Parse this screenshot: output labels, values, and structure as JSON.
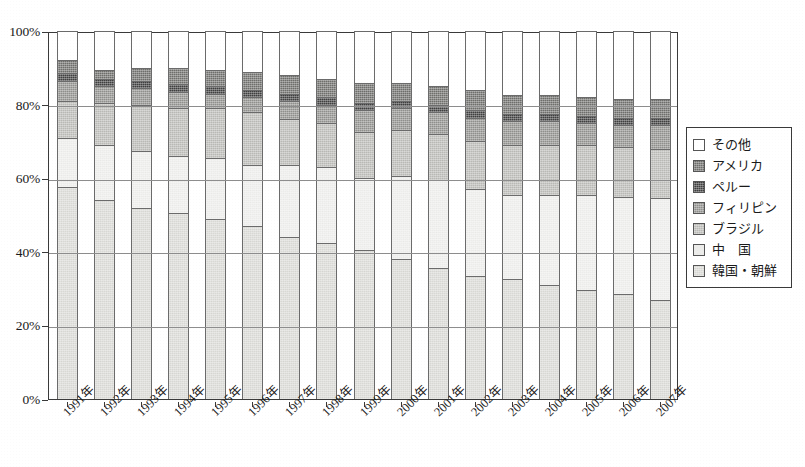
{
  "chart_data": {
    "type": "bar",
    "subtype": "stacked-100-percent",
    "title": "",
    "xlabel": "",
    "ylabel": "",
    "ylim": [
      0,
      100
    ],
    "ytick_labels": [
      "0%",
      "20%",
      "40%",
      "60%",
      "80%",
      "100%"
    ],
    "ytick_values": [
      0,
      20,
      40,
      60,
      80,
      100
    ],
    "grid": true,
    "legend_position": "right",
    "stack_order_bottom_to_top": [
      "韓国・朝鮮",
      "中　国",
      "ブラジル",
      "フィリピン",
      "ペルー",
      "アメリカ",
      "その他"
    ],
    "categories": [
      "1991年",
      "1992年",
      "1993年",
      "1994年",
      "1995年",
      "1996年",
      "1997年",
      "1998年",
      "1999年",
      "2000年",
      "2001年",
      "2002年",
      "2003年",
      "2004年",
      "2005年",
      "2006年",
      "2007年"
    ],
    "series": [
      {
        "name": "韓国・朝鮮",
        "color": "#d8d8d4",
        "values": [
          57.5,
          54.0,
          52.0,
          50.5,
          49.0,
          47.0,
          44.0,
          42.5,
          40.5,
          38.0,
          35.5,
          33.5,
          32.5,
          31.0,
          29.5,
          28.5,
          27.0
        ]
      },
      {
        "name": "中　国",
        "color": "#ececea",
        "values": [
          13.5,
          15.0,
          15.5,
          15.5,
          16.5,
          16.5,
          19.5,
          20.5,
          19.5,
          22.5,
          24.0,
          23.5,
          23.0,
          24.5,
          26.0,
          26.5,
          27.5
        ]
      },
      {
        "name": "ブラジル",
        "color": "#b9b9b5",
        "values": [
          10.0,
          11.5,
          12.5,
          13.0,
          13.5,
          14.5,
          12.5,
          12.0,
          12.5,
          12.5,
          12.5,
          13.0,
          13.5,
          13.5,
          13.5,
          13.5,
          13.5
        ]
      },
      {
        "name": "フィリピン",
        "color": "#8f8f8c",
        "values": [
          5.5,
          4.5,
          4.5,
          4.5,
          4.0,
          4.0,
          5.0,
          5.0,
          6.0,
          6.0,
          6.0,
          6.5,
          6.5,
          6.5,
          6.0,
          6.0,
          6.5
        ]
      },
      {
        "name": "ペルー",
        "color": "#3f3f3f",
        "values": [
          2.0,
          2.0,
          2.0,
          2.0,
          2.0,
          2.0,
          2.0,
          2.0,
          2.0,
          2.0,
          2.0,
          2.0,
          2.0,
          2.0,
          2.0,
          2.0,
          2.0
        ]
      },
      {
        "name": "アメリカ",
        "color": "#6e6e6b",
        "values": [
          3.5,
          2.5,
          3.5,
          4.5,
          4.5,
          5.0,
          5.0,
          5.0,
          5.5,
          5.0,
          5.0,
          5.5,
          5.0,
          5.0,
          5.0,
          5.0,
          5.0
        ]
      },
      {
        "name": "その他",
        "color": "#ffffff",
        "values": [
          8.0,
          10.5,
          10.0,
          10.0,
          10.5,
          11.0,
          12.0,
          13.0,
          14.0,
          14.0,
          15.0,
          16.0,
          17.5,
          17.5,
          18.0,
          18.5,
          18.5
        ]
      }
    ]
  },
  "legend": {
    "items": [
      {
        "label": "その他",
        "color": "#ffffff",
        "textured": false
      },
      {
        "label": "アメリカ",
        "color": "#6e6e6b",
        "textured": true
      },
      {
        "label": "ペルー",
        "color": "#3f3f3f",
        "textured": true
      },
      {
        "label": "フィリピン",
        "color": "#8f8f8c",
        "textured": true
      },
      {
        "label": "ブラジル",
        "color": "#b9b9b5",
        "textured": true
      },
      {
        "label": "中　国",
        "color": "#ececea",
        "textured": false
      },
      {
        "label": "韓国・朝鮮",
        "color": "#d8d8d4",
        "textured": true
      }
    ]
  }
}
